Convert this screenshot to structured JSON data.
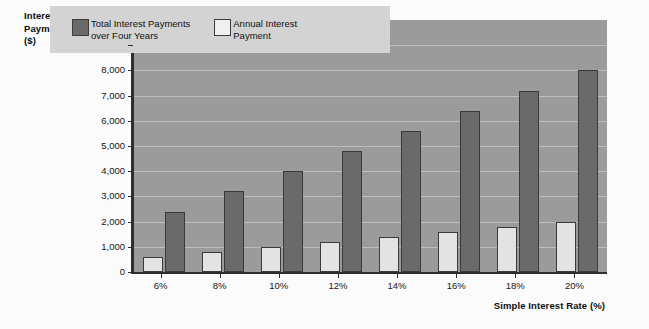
{
  "chart_data": {
    "type": "bar",
    "title": "",
    "xlabel": "Simple Interest Rate (%)",
    "ylabel": "Interest Payments ($)",
    "ylabel_lines": [
      "Interest",
      "Payments",
      "($)"
    ],
    "categories": [
      "6%",
      "8%",
      "10%",
      "12%",
      "14%",
      "16%",
      "18%",
      "20%"
    ],
    "ylim": [
      0,
      10000
    ],
    "ytick_labels": [
      "10,000",
      "9,000",
      "8,000",
      "7,000",
      "6,000",
      "5,000",
      "4,000",
      "3,000",
      "2,000",
      "1,000",
      "0"
    ],
    "ytick_values": [
      10000,
      9000,
      8000,
      7000,
      6000,
      5000,
      4000,
      3000,
      2000,
      1000,
      0
    ],
    "grid": true,
    "legend_position": "top-left-inside",
    "series": [
      {
        "name": "Annual Interest Payment",
        "color": "#e3e3e3",
        "values": [
          600,
          800,
          1000,
          1200,
          1400,
          1600,
          1800,
          2000
        ]
      },
      {
        "name": "Total Interest Payments over Four Years",
        "color": "#6a6a6a",
        "values": [
          2400,
          3200,
          4000,
          4800,
          5600,
          6400,
          7200,
          8000
        ]
      }
    ]
  },
  "legend": {
    "entries": [
      {
        "label_line1": "Total Interest Payments",
        "label_line2": "over Four Years",
        "swatch": "total"
      },
      {
        "label_line1": "Annual Interest",
        "label_line2": "Payment",
        "swatch": "annual"
      }
    ]
  },
  "colors": {
    "plot_background": "#9b9b9b",
    "gridline": "#bdbdbd",
    "axis": "#2e2e2e",
    "bar_total": "#6a6a6a",
    "bar_annual": "#e3e3e3",
    "legend_background": "#d3d3d3",
    "page_background": "#fbfbfb"
  }
}
